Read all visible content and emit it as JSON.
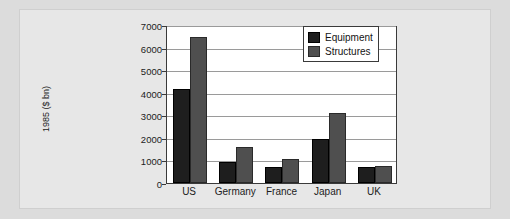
{
  "chart_data": {
    "type": "bar",
    "title": "",
    "subtitle": "",
    "xlabel": "",
    "ylabel": "1985 ($ bn)",
    "categories": [
      "US",
      "Germany",
      "France",
      "Japan",
      "UK"
    ],
    "series": [
      {
        "name": "Equipment",
        "color": "#1e1e1e",
        "values": [
          4150,
          950,
          700,
          1950,
          700
        ]
      },
      {
        "name": "Structures",
        "color": "#4f4f4f",
        "values": [
          6450,
          1600,
          1080,
          3120,
          760
        ]
      }
    ],
    "ylim": [
      0,
      7000
    ],
    "yticks": [
      0,
      1000,
      2000,
      3000,
      4000,
      5000,
      6000,
      7000
    ],
    "ytick_labels": [
      "0",
      "1000",
      "2000",
      "3000",
      "4000",
      "5000",
      "6000",
      "7000"
    ],
    "grid": true,
    "legend_position": "top-right",
    "legend_entries": [
      "Equipment",
      "Structures"
    ]
  }
}
